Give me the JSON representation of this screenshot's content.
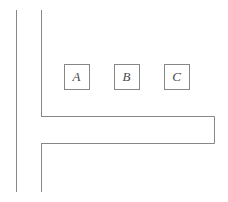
{
  "canvas": {
    "width": 228,
    "height": 202,
    "background": "#ffffff"
  },
  "style": {
    "stroke_color": "#878787",
    "stroke_width": 1,
    "label_color": "#4a4a4a",
    "label_font_size": 13
  },
  "diagram": {
    "vertical_lines": [
      {
        "name": "outer-vertical-line",
        "x": 16,
        "y1": 10,
        "y2": 192
      },
      {
        "name": "inner-vertical-line-upper",
        "x": 41,
        "y1": 10,
        "y2": 116
      },
      {
        "name": "inner-vertical-line-lower",
        "x": 41,
        "y1": 143,
        "y2": 192
      }
    ],
    "band": {
      "name": "horizontal-band",
      "x1": 41,
      "x2": 214,
      "y_top": 116,
      "y_bottom": 143
    },
    "boxes": [
      {
        "name": "box-a",
        "label": "A",
        "x": 64,
        "y": 64,
        "width": 25,
        "height": 25
      },
      {
        "name": "box-b",
        "label": "B",
        "x": 114,
        "y": 64,
        "width": 25,
        "height": 25
      },
      {
        "name": "box-c",
        "label": "C",
        "x": 164,
        "y": 64,
        "width": 25,
        "height": 25
      }
    ]
  }
}
